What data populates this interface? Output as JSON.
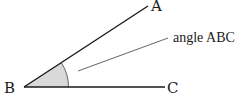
{
  "diagram": {
    "type": "geometry-angle",
    "vertex": {
      "label": "B",
      "x": 24,
      "y": 87
    },
    "ray_a": {
      "label": "A",
      "x": 148,
      "y": 6
    },
    "ray_c": {
      "label": "C",
      "x": 165,
      "y": 87
    },
    "annotation": {
      "text": "angle ABC"
    },
    "colors": {
      "line": "#1a1a1a",
      "fill": "#d9d9d9",
      "leader": "#555555",
      "background": "#ffffff"
    }
  }
}
